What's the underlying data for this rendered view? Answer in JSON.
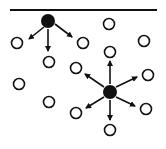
{
  "diagram": {
    "surface": {
      "x1": 10,
      "x2": 157,
      "y": 10,
      "color": "#111111",
      "width": 2.2
    },
    "filled_particles": [
      {
        "id": "surface-particle",
        "cx": 48,
        "cy": 21,
        "r": 7
      },
      {
        "id": "bulk-particle",
        "cx": 110,
        "cy": 92,
        "r": 7
      }
    ],
    "open_particles": [
      {
        "cx": 17,
        "cy": 43
      },
      {
        "cx": 49,
        "cy": 62
      },
      {
        "cx": 83,
        "cy": 43
      },
      {
        "cx": 109,
        "cy": 24
      },
      {
        "cx": 144,
        "cy": 41
      },
      {
        "cx": 110,
        "cy": 52
      },
      {
        "cx": 76,
        "cy": 68
      },
      {
        "cx": 148,
        "cy": 75
      },
      {
        "cx": 19,
        "cy": 84
      },
      {
        "cx": 49,
        "cy": 102
      },
      {
        "cx": 76,
        "cy": 113
      },
      {
        "cx": 146,
        "cy": 109
      },
      {
        "cx": 110,
        "cy": 130
      }
    ],
    "open_radius": 5.5,
    "arrows": [
      {
        "from": [
          44,
          27
        ],
        "to": [
          29,
          39
        ]
      },
      {
        "from": [
          48,
          29
        ],
        "to": [
          48,
          51
        ]
      },
      {
        "from": [
          55,
          24
        ],
        "to": [
          72,
          37
        ]
      },
      {
        "from": [
          110,
          84
        ],
        "to": [
          110,
          61
        ]
      },
      {
        "from": [
          104,
          87
        ],
        "to": [
          85,
          74
        ]
      },
      {
        "from": [
          116,
          87
        ],
        "to": [
          137,
          77
        ]
      },
      {
        "from": [
          104,
          97
        ],
        "to": [
          86,
          108
        ]
      },
      {
        "from": [
          116,
          97
        ],
        "to": [
          135,
          106
        ]
      },
      {
        "from": [
          110,
          100
        ],
        "to": [
          110,
          120
        ]
      }
    ],
    "stroke_color": "#111111"
  }
}
